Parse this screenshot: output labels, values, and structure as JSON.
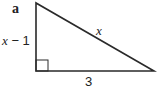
{
  "figure": {
    "part_label": "a",
    "vertical_leg_label_var": "x",
    "vertical_leg_label_rest": " − 1",
    "hypotenuse_label": "x",
    "base_label": "3",
    "right_angle": "bottom-left",
    "stroke_color": "#2a2a2a"
  }
}
